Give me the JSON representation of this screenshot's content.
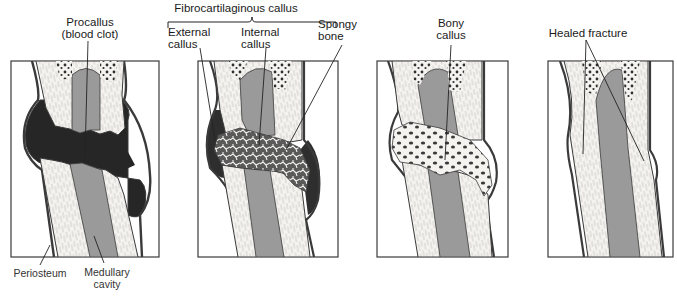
{
  "figure": {
    "colors": {
      "outline": "#3a3a3a",
      "compact_bone": "#f4f3f0",
      "medullary_cavity": "#9a9a9a",
      "blood_clot": "#262626",
      "fibro_callus": "#5a5a5a",
      "spongy_marrow": "#2e2e2e",
      "background": "#ffffff"
    },
    "panels": [
      {
        "id": 1,
        "stage": "Hematoma formation",
        "labels": {
          "top_line1": "Procallus",
          "top_line2": "(blood clot)",
          "bottom_left": "Periosteum",
          "bottom_right_line1": "Medullary",
          "bottom_right_line2": "cavity"
        }
      },
      {
        "id": 2,
        "stage": "Fibrocartilaginous callus formation",
        "labels": {
          "group": "Fibrocartilaginous callus",
          "left_line1": "External",
          "left_line2": "callus",
          "mid_line1": "Internal",
          "mid_line2": "callus",
          "right_line1": "Spongy",
          "right_line2": "bone"
        }
      },
      {
        "id": 3,
        "stage": "Bony callus formation",
        "labels": {
          "top_line1": "Bony",
          "top_line2": "callus"
        }
      },
      {
        "id": 4,
        "stage": "Bone remodeling",
        "labels": {
          "top": "Healed fracture"
        }
      }
    ]
  }
}
